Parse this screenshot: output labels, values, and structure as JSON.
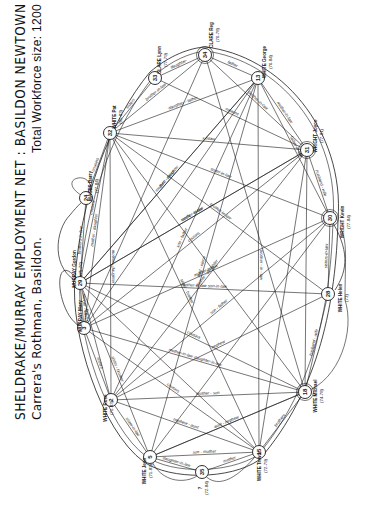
{
  "title": {
    "main": "SHELDRAKE/MURRAY  EMPLOYMENT  NET  :  BASILDON  NEWTOWN  1970-1984*",
    "subtitle_left": "Carrera's  Rothman, Basildon.",
    "subtitle_right": "Total  Workforce  size:  1200"
  },
  "colors": {
    "ink": "#1a1a1a",
    "paper": "#ffffff"
  },
  "nodes": [
    {
      "id": "34",
      "name": "CLARE Reg",
      "years": "(76-78)",
      "x": 205,
      "y": 55
    },
    {
      "id": "33",
      "name": "CLARE Lynn",
      "years": "(77-79)",
      "x": 155,
      "y": 78
    },
    {
      "id": "13",
      "name": "WHITE George",
      "years": "(76-84)",
      "x": 258,
      "y": 78
    },
    {
      "id": "32",
      "name": "WHITE Pat",
      "years": "(81-83)",
      "x": 110,
      "y": 133
    },
    {
      "id": "31",
      "name": "WRIGHT Joyce",
      "years": "(77-81)",
      "x": 307,
      "y": 150
    },
    {
      "id": "24",
      "name": "MACES Barry",
      "years": "(77-84)",
      "x": 86,
      "y": 198
    },
    {
      "id": "30",
      "name": "WRIGHT Kevin",
      "years": "(77-84)",
      "x": 330,
      "y": 218
    },
    {
      "id": "29",
      "name": "MURRAY Gordon",
      "years": "(75-76)",
      "x": 80,
      "y": 283
    },
    {
      "id": "28",
      "name": "WHITE Helen",
      "years": "(73)",
      "x": 328,
      "y": 294
    },
    {
      "id": "3",
      "name": "MURRAY Mary",
      "years": "(75-82)",
      "x": 84,
      "y": 328
    },
    {
      "id": "18",
      "name": "WHITE Michael",
      "years": "(74-78)",
      "x": 305,
      "y": 392
    },
    {
      "id": "2",
      "name": "WHITE Rose",
      "years": "(71-83)",
      "x": 111,
      "y": 400
    },
    {
      "id": "5",
      "name": "WHITE Jean",
      "years": "(71-83)",
      "x": 150,
      "y": 457
    },
    {
      "id": "35",
      "name": "?",
      "years": "(72-84)",
      "x": 202,
      "y": 472
    },
    {
      "id": "15",
      "name": "WHITE Trevor",
      "years": "(72-79)",
      "x": 259,
      "y": 452
    }
  ],
  "edges": [
    {
      "from": "34",
      "to": "33",
      "label": "daughter-"
    },
    {
      "from": "34",
      "to": "13",
      "label": "father"
    },
    {
      "from": "33",
      "to": "32",
      "label": "sisters"
    },
    {
      "from": "13",
      "to": "31",
      "label": "mother-in-law"
    },
    {
      "from": "31",
      "to": "30",
      "label": "husband - wife"
    },
    {
      "from": "30",
      "to": "28",
      "label": "sisters-in-law"
    },
    {
      "from": "28",
      "to": "18",
      "label": "husband - wife"
    },
    {
      "from": "18",
      "to": "15",
      "label": "brothers"
    },
    {
      "from": "15",
      "to": "35",
      "label": "mother"
    },
    {
      "from": "5",
      "to": "35",
      "label": "daughter-in-law"
    },
    {
      "from": "5",
      "to": "2",
      "label": "sister-in-law"
    },
    {
      "from": "2",
      "to": "3",
      "label": "sisters"
    },
    {
      "from": "3",
      "to": "29",
      "label": "mother - son"
    },
    {
      "from": "29",
      "to": "24",
      "label": "brothers-in-law"
    },
    {
      "from": "29",
      "to": "32",
      "label": "cousins"
    },
    {
      "from": "32",
      "to": "34",
      "label": "brother-in-law"
    },
    {
      "from": "32",
      "to": "31",
      "label": "x-inlaw"
    },
    {
      "from": "32",
      "to": "13",
      "label": "daughter - father"
    },
    {
      "from": "33",
      "to": "31",
      "label": "cousins"
    },
    {
      "from": "34",
      "to": "31",
      "label": "brother-in-law"
    },
    {
      "from": "34",
      "to": "18",
      "label": ""
    },
    {
      "from": "34",
      "to": "3",
      "label": ""
    },
    {
      "from": "13",
      "to": "30",
      "label": "father-in-law"
    },
    {
      "from": "13",
      "to": "29",
      "label": "mother - daughter"
    },
    {
      "from": "13",
      "to": "2",
      "label": "son - father"
    },
    {
      "from": "13",
      "to": "15",
      "label": "brother - in - law"
    },
    {
      "from": "13",
      "to": "5",
      "label": "aunt - niece"
    },
    {
      "from": "13",
      "to": "3",
      "label": ""
    },
    {
      "from": "31",
      "to": "29",
      "label": "mother-in-law"
    },
    {
      "from": "31",
      "to": "2",
      "label": "mother - daughter"
    },
    {
      "from": "31",
      "to": "3",
      "label": "cousins"
    },
    {
      "from": "31",
      "to": "15",
      "label": ""
    },
    {
      "from": "31",
      "to": "18",
      "label": ""
    },
    {
      "from": "30",
      "to": "3",
      "label": "mother-in-law"
    },
    {
      "from": "30",
      "to": "2",
      "label": "son - father"
    },
    {
      "from": "30",
      "to": "32",
      "label": "sister-in-law"
    },
    {
      "from": "30",
      "to": "5",
      "label": ""
    },
    {
      "from": "28",
      "to": "29",
      "label": "mother-in-law  son-in-law"
    },
    {
      "from": "28",
      "to": "32",
      "label": "brother-in-law"
    },
    {
      "from": "28",
      "to": "2",
      "label": "nephew"
    },
    {
      "from": "18",
      "to": "3",
      "label": "mother-in-law  daughter-in-law"
    },
    {
      "from": "18",
      "to": "2",
      "label": "mother - son"
    },
    {
      "from": "18",
      "to": "29",
      "label": "cousins"
    },
    {
      "from": "18",
      "to": "32",
      "label": ""
    },
    {
      "from": "18",
      "to": "5",
      "label": ""
    },
    {
      "from": "15",
      "to": "2",
      "label": "nephew - aunt"
    },
    {
      "from": "15",
      "to": "3",
      "label": "cousins"
    },
    {
      "from": "15",
      "to": "5",
      "label": "son - mother"
    },
    {
      "from": "15",
      "to": "32",
      "label": "sister - brother"
    },
    {
      "from": "15",
      "to": "29",
      "label": ""
    },
    {
      "from": "5",
      "to": "18",
      "label": "aunt - nephew"
    },
    {
      "from": "5",
      "to": "29",
      "label": "sister - brother"
    },
    {
      "from": "2",
      "to": "32",
      "label": "mother - daughter"
    },
    {
      "from": "2",
      "to": "29",
      "label": ""
    },
    {
      "from": "3",
      "to": "32",
      "label": "mother - daughter"
    },
    {
      "from": "24",
      "to": "32",
      "label": "cousins"
    },
    {
      "from": "29",
      "to": "31",
      "label": "uncle - niece"
    },
    {
      "from": "29",
      "to": "13",
      "label": "aunt - niece"
    }
  ],
  "outer_links": [
    {
      "label": "mother-in-law",
      "between": [
        "3",
        "24"
      ]
    },
    {
      "label": "son-in-law",
      "between": [
        "29",
        "24"
      ]
    },
    {
      "label": "brothers-in-law",
      "between": [
        "28",
        "18"
      ]
    },
    {
      "label": "sister-in-law",
      "between": [
        "18",
        "28"
      ]
    },
    {
      "label": "sister-in-law",
      "between": [
        "15",
        "18"
      ]
    }
  ]
}
